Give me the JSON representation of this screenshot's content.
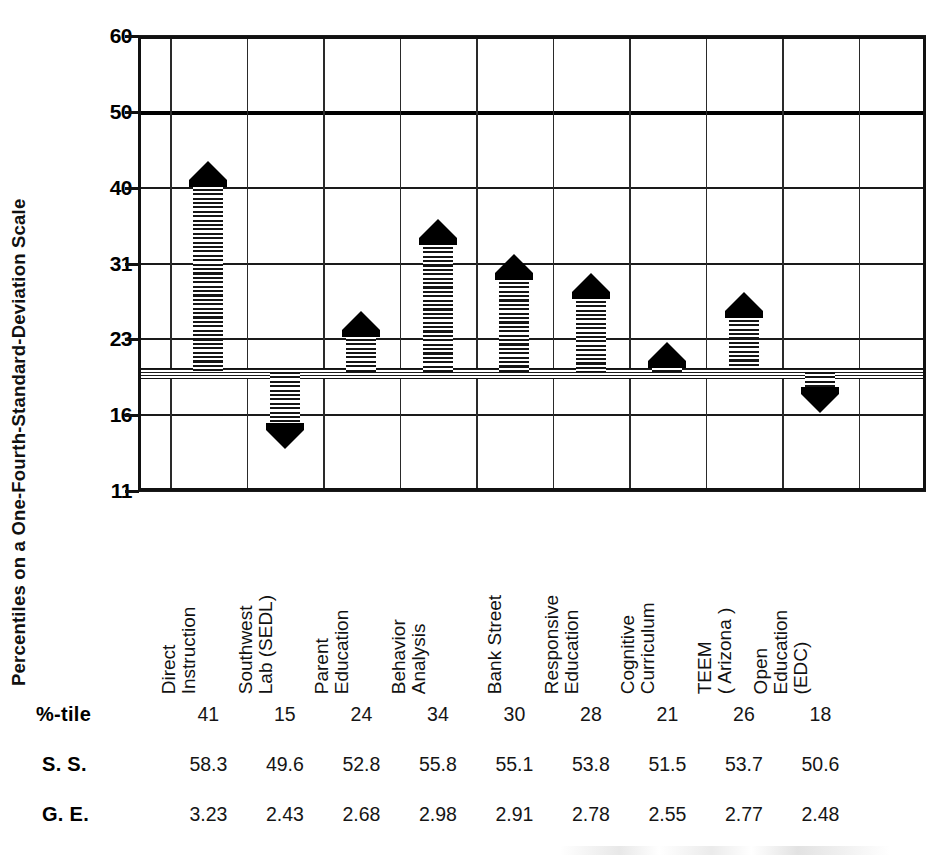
{
  "axis": {
    "y_title": "Percentiles on a One-Fourth-Standard-Deviation Scale",
    "y_ticks": [
      "60",
      "50",
      "40",
      "31",
      "23",
      "16",
      "11"
    ]
  },
  "table": {
    "row_labels": [
      "%-tile",
      "S. S.",
      "G. E."
    ],
    "percentile": [
      "41",
      "15",
      "24",
      "34",
      "30",
      "28",
      "21",
      "26",
      "18"
    ],
    "ss": [
      "58.3",
      "49.6",
      "52.8",
      "55.8",
      "55.1",
      "53.8",
      "51.5",
      "53.7",
      "50.6"
    ],
    "ge": [
      "3.23",
      "2.43",
      "2.68",
      "2.98",
      "2.91",
      "2.78",
      "2.55",
      "2.77",
      "2.48"
    ]
  },
  "chart_data": {
    "type": "bar",
    "title": "",
    "xlabel": "",
    "ylabel": "Percentiles on a One-Fourth-Standard-Deviation Scale",
    "ylim": [
      11,
      60
    ],
    "ytick_values": [
      60,
      50,
      40,
      31,
      23,
      16,
      11
    ],
    "grid": true,
    "legend": "none",
    "baseline_percentile": 20,
    "categories": [
      "Direct Instruction",
      "Southwest Lab (SEDL)",
      "Parent Education",
      "Behavior Analysis",
      "Bank Street",
      "Responsive Education",
      "Cognitive Curriculum",
      "TEEM ( Arizona )",
      "Open Education (EDC)"
    ],
    "category_lines": [
      [
        "Direct",
        "Instruction"
      ],
      [
        "Southwest",
        "Lab (SEDL)"
      ],
      [
        "Parent",
        "Education"
      ],
      [
        "Behavior",
        "Analysis"
      ],
      [
        "Bank Street",
        ""
      ],
      [
        "Responsive",
        "Education"
      ],
      [
        "Cognitive",
        "Curriculum"
      ],
      [
        "TEEM",
        "( Arizona )"
      ],
      [
        "Open",
        "Education",
        "(EDC)"
      ]
    ],
    "series": [
      {
        "name": "Percentile",
        "values": [
          41,
          15,
          24,
          34,
          30,
          28,
          21,
          26,
          18
        ],
        "direction": [
          "up",
          "down",
          "up",
          "up",
          "up",
          "up",
          "up",
          "up",
          "down"
        ]
      },
      {
        "name": "Scaled Score (S. S.)",
        "values": [
          58.3,
          49.6,
          52.8,
          55.8,
          55.1,
          53.8,
          51.5,
          53.7,
          50.6
        ]
      },
      {
        "name": "Grade Equivalent (G. E.)",
        "values": [
          3.23,
          2.43,
          2.68,
          2.98,
          2.91,
          2.78,
          2.55,
          2.77,
          2.48
        ]
      }
    ]
  },
  "colors": {
    "ink": "#111111",
    "paper": "#ffffff"
  }
}
